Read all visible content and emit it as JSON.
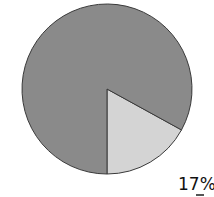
{
  "chart_data": {
    "type": "pie",
    "title": "",
    "start_angle_deg": 90,
    "direction": "counterclockwise",
    "slices": [
      {
        "name": "slice-small",
        "value": 17,
        "color": "#d4d4d4"
      },
      {
        "name": "slice-large",
        "value": 83,
        "color": "#8a8a8a"
      }
    ],
    "labels": [
      {
        "text": "17%",
        "slice": "slice-small"
      }
    ]
  }
}
